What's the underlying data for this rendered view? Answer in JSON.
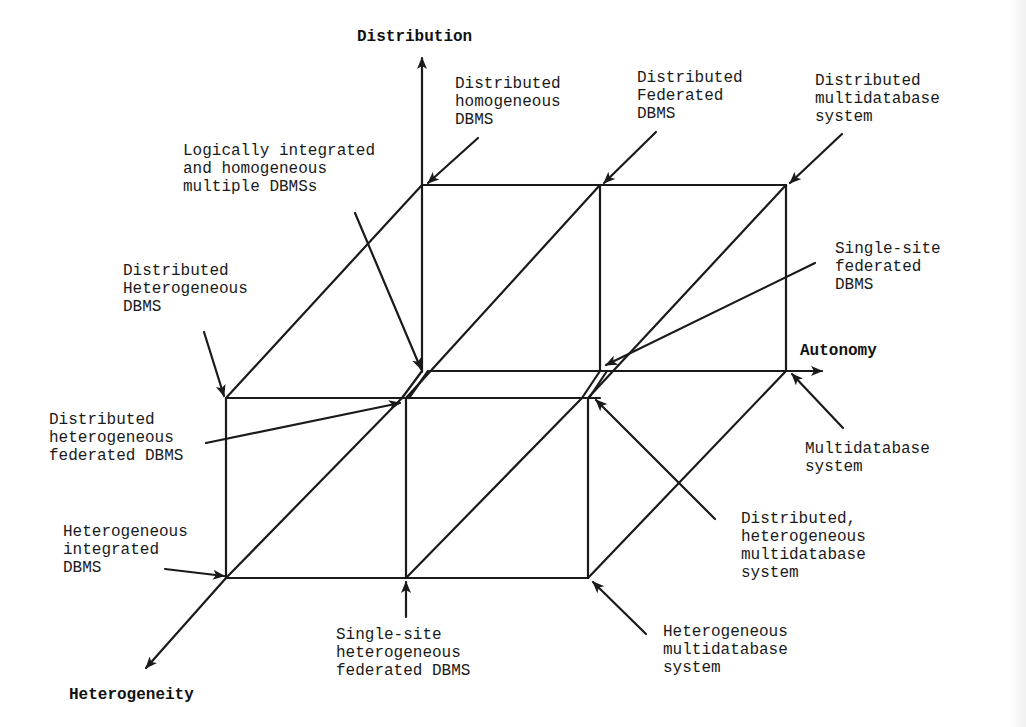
{
  "diagram": {
    "type": "3D classification cube of database systems",
    "colors": {
      "ink": "#1a1a1a",
      "background": "#ffffff"
    },
    "axes": {
      "distribution": "Distribution",
      "autonomy": "Autonomy",
      "heterogeneity": "Heterogeneity"
    },
    "labels": {
      "distributed_homogeneous": "Distributed\nhomogeneous\nDBMS",
      "distributed_federated": "Distributed\nFederated\nDBMS",
      "distributed_multidatabase": "Distributed\nmultidatabase\nsystem",
      "logically_integrated": "Logically integrated\nand homogeneous\nmultiple DBMSs",
      "single_site_federated": "Single-site\nfederated\nDBMS",
      "distributed_heterogeneous": "Distributed\nHeterogeneous\nDBMS",
      "multidatabase_system": "Multidatabase\nsystem",
      "distributed_heterogeneous_federated": "Distributed\nheterogeneous\nfederated DBMS",
      "distributed_heterogeneous_multidatabase": "Distributed,\nheterogeneous\nmultidatabase\nsystem",
      "heterogeneous_integrated": "Heterogeneous\nintegrated\nDBMS",
      "single_site_heterogeneous_federated": "Single-site\nheterogeneous\nfederated DBMS",
      "heterogeneous_multidatabase": "Heterogeneous\nmultidatabase\nsystem"
    }
  }
}
